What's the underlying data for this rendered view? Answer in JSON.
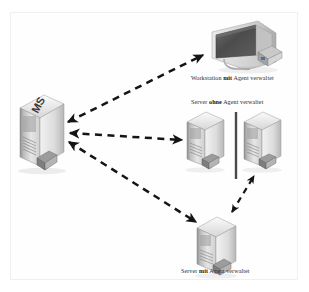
{
  "diagram": {
    "type": "network-topology",
    "background_color": "#ffffff",
    "frame_color": "#f0f0f0",
    "nodes": [
      {
        "id": "ms-server",
        "icon": "server-tower-icon",
        "badge_text": "MS",
        "label": "",
        "x": 18,
        "y": 96,
        "w": 46,
        "h": 68
      },
      {
        "id": "workstation-agent",
        "icon": "workstation-monitor-icon",
        "label_plain_before": "Workstation ",
        "label_bold": "mit",
        "label_plain_after": " Agent verwaltet",
        "x": 206,
        "y": 18,
        "w": 84,
        "h": 54
      },
      {
        "id": "server-no-agent",
        "icon": "server-tower-icon",
        "label_plain_before": "Server ",
        "label_bold": "ohne",
        "label_plain_after": " Agent verwaltet",
        "x": 186,
        "y": 112,
        "w": 44,
        "h": 60
      },
      {
        "id": "server-proxy-right",
        "icon": "server-tower-icon",
        "label": "",
        "x": 243,
        "y": 112,
        "w": 44,
        "h": 60
      },
      {
        "id": "server-with-agent",
        "icon": "server-tower-icon",
        "label_plain_before": "Server ",
        "label_bold": "mit",
        "label_plain_after": " Agent verwaltet",
        "x": 196,
        "y": 216,
        "w": 46,
        "h": 62
      }
    ],
    "labels": {
      "workstation": "Workstation mit Agent verwaltet",
      "server_ohne": "Server ohne Agent verwaltet",
      "server_mit": "Server mit Agent verwaltet",
      "ms_badge": "MS"
    },
    "connections": [
      {
        "from": "ms-server",
        "to": "workstation-agent",
        "style": "dashed",
        "arrows": "both",
        "color": "#1a1a1a"
      },
      {
        "from": "ms-server",
        "to": "server-no-agent",
        "style": "dashed",
        "arrows": "both",
        "color": "#1a1a1a"
      },
      {
        "from": "ms-server",
        "to": "server-with-agent",
        "style": "dashed",
        "arrows": "both",
        "color": "#1a1a1a"
      },
      {
        "from": "server-with-agent",
        "to": "server-proxy-right",
        "style": "dashed",
        "arrows": "both",
        "color": "#1a1a1a"
      }
    ],
    "divider": {
      "name": "vertical-divider",
      "x": 236,
      "y1": 112,
      "y2": 179,
      "color": "#4a4a4a",
      "width": 2.4
    }
  }
}
